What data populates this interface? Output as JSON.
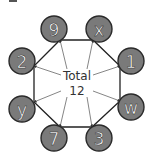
{
  "diagram": {
    "type": "octagon-sum-puzzle",
    "center": {
      "label": "Total",
      "value": "12"
    },
    "nodes": [
      {
        "id": "top-left",
        "label": "9",
        "cx": 54,
        "cy": 29
      },
      {
        "id": "top-right",
        "label": "x",
        "cx": 99,
        "cy": 29
      },
      {
        "id": "right-top",
        "label": "1",
        "cx": 131,
        "cy": 61
      },
      {
        "id": "right-bottom",
        "label": "w",
        "cx": 131,
        "cy": 107
      },
      {
        "id": "bottom-right",
        "label": "3",
        "cx": 99,
        "cy": 138
      },
      {
        "id": "bottom-left",
        "label": "7",
        "cx": 54,
        "cy": 138
      },
      {
        "id": "left-bottom",
        "label": "y",
        "cx": 22,
        "cy": 109
      },
      {
        "id": "left-top",
        "label": "2",
        "cx": 22,
        "cy": 61
      }
    ],
    "octagon_vertices": [
      [
        60,
        40
      ],
      [
        93,
        40
      ],
      [
        120,
        66
      ],
      [
        120,
        101
      ],
      [
        92,
        127
      ],
      [
        60,
        127
      ],
      [
        34,
        102
      ],
      [
        34,
        66
      ]
    ],
    "colors": {
      "node_fill": "#7a7a7a",
      "node_stroke": "#2a2a2a",
      "node_text": "#ffffff",
      "line": "#222222",
      "background": "#ffffff"
    }
  }
}
